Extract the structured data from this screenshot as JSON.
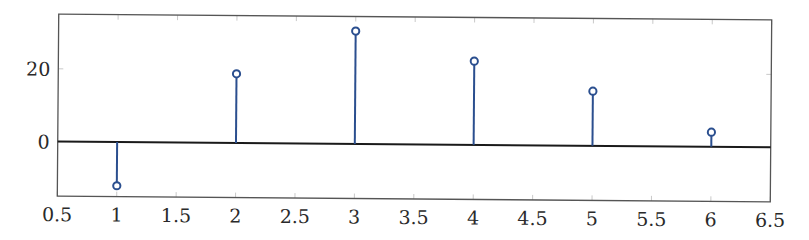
{
  "chart_data": {
    "type": "stem",
    "title": "",
    "xlabel": "",
    "ylabel": "",
    "x": [
      1,
      2,
      3,
      4,
      5,
      6
    ],
    "values": [
      -12,
      19,
      31,
      23,
      15,
      4
    ],
    "series": [
      {
        "name": "stem",
        "x": [
          1,
          2,
          3,
          4,
          5,
          6
        ],
        "values": [
          -12,
          19,
          31,
          23,
          15,
          4
        ],
        "color": "#2b4f8f",
        "marker": "open-circle"
      }
    ],
    "xlim": [
      0.5,
      6.5
    ],
    "ylim": [
      -15,
      35
    ],
    "xticks": [
      0.5,
      1,
      1.5,
      2,
      2.5,
      3,
      3.5,
      4,
      4.5,
      5,
      5.5,
      6,
      6.5
    ],
    "xtick_labels": [
      "0.5",
      "1",
      "1.5",
      "2",
      "2.5",
      "3",
      "3.5",
      "4",
      "4.5",
      "5",
      "5.5",
      "6",
      "6.5"
    ],
    "yticks": [
      0,
      20
    ],
    "ytick_labels": [
      "0",
      "20"
    ],
    "baseline": 0,
    "grid": false,
    "legend": null
  },
  "colors": {
    "stem": "#2b4f8f",
    "baseline": "#1a1a1a",
    "axis": "#555555",
    "tick": "#bbbbbb"
  }
}
